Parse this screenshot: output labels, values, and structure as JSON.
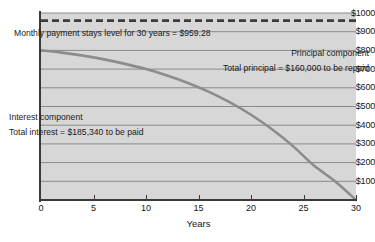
{
  "chart_data": {
    "type": "line",
    "title": "",
    "xlabel": "Years",
    "ylabel": "",
    "xlim": [
      0,
      30
    ],
    "ylim": [
      0,
      1000
    ],
    "grid": true,
    "legend_position": "none",
    "x_ticks": [
      "0",
      "5",
      "10",
      "15",
      "20",
      "25",
      "30"
    ],
    "x_tick_values": [
      0,
      5,
      10,
      15,
      20,
      25,
      30
    ],
    "y_ticks": [
      "$100",
      "$200",
      "$300",
      "$400",
      "$500",
      "$600",
      "$700",
      "$800",
      "$900",
      "$1000"
    ],
    "y_tick_values": [
      100,
      200,
      300,
      400,
      500,
      600,
      700,
      800,
      900,
      1000
    ],
    "series": [
      {
        "name": "Interest component",
        "style": "solid",
        "color": "#8c8c8c",
        "x": [
          0,
          2,
          4,
          6,
          8,
          10,
          12,
          14,
          16,
          18,
          20,
          22,
          24,
          26,
          28,
          30
        ],
        "values": [
          800,
          788,
          772,
          752,
          728,
          700,
          666,
          626,
          578,
          522,
          456,
          378,
          288,
          184,
          100,
          0
        ]
      },
      {
        "name": "Monthly payment stays level for 30 years",
        "style": "dashed",
        "color": "#3c3c3c",
        "x": [
          0,
          30
        ],
        "values": [
          959.28,
          959.28
        ]
      }
    ],
    "annotations": [
      "Monthly payment stays level for 30 years = $959.28",
      "Principal component",
      "Total principal = $160,000 to be repaid",
      "Interest component",
      "Total interest = $185,340 to be paid"
    ]
  },
  "annotations": {
    "monthly_payment": "Monthly payment stays level for 30 years = $959.28",
    "principal_title": "Principal component",
    "principal_total": "Total principal = $160,000 to be repaid",
    "interest_title": "Interest component",
    "interest_total": "Total interest = $185,340 to be paid"
  },
  "axes": {
    "x_title": "Years"
  },
  "colors": {
    "plot_background": "#d7d7d7",
    "gridline": "#8a8a8a",
    "axis": "#3a3a3a",
    "curve": "#8c8c8c",
    "payment_line": "#3c3c3c",
    "text": "#1a1a1a"
  }
}
